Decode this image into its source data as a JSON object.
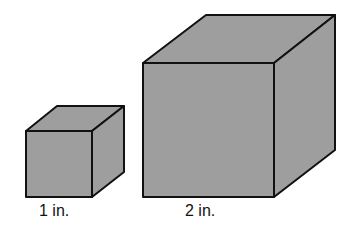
{
  "diagram": {
    "type": "cube-comparison",
    "colors": {
      "face_fill": "#9e9e9e",
      "edge_stroke": "#111111",
      "background": "#ffffff"
    },
    "cubes": [
      {
        "name": "small-cube",
        "edge_label": "1 in."
      },
      {
        "name": "large-cube",
        "edge_label": "2 in."
      }
    ]
  }
}
